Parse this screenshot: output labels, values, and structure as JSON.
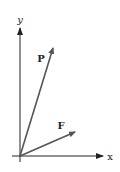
{
  "diagram": {
    "axes": {
      "origin": [
        20,
        156
      ],
      "x_axis": {
        "label": "x",
        "start": [
          12,
          156
        ],
        "end": [
          104,
          156
        ],
        "label_pos": [
          110,
          160
        ]
      },
      "y_axis": {
        "label": "y",
        "start": [
          20,
          162
        ],
        "end": [
          20,
          27
        ],
        "label_pos": [
          20,
          21
        ]
      }
    },
    "vectors": [
      {
        "name": "P",
        "label": "P",
        "tip": [
          54,
          47
        ],
        "label_pos": [
          41,
          62
        ]
      },
      {
        "name": "F",
        "label": "F",
        "tip": [
          76,
          132
        ],
        "label_pos": [
          61,
          128
        ]
      }
    ],
    "colors": {
      "axes": "#222222",
      "vectors": "#555555"
    }
  }
}
